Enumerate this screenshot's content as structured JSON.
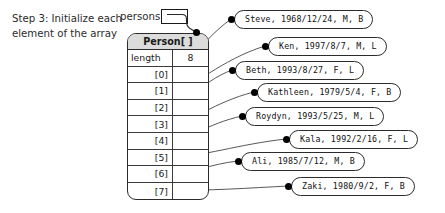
{
  "caption": {
    "text": "Step 3: Initialize each\nelement of the array"
  },
  "pointer_variable": {
    "label": "persons",
    "value": ""
  },
  "array": {
    "type_header": "Person[ ]",
    "length_label": "length",
    "length_value": "8",
    "indices": [
      "[0]",
      "[1]",
      "[2]",
      "[3]",
      "[4]",
      "[5]",
      "[6]",
      "[7]"
    ],
    "cell_values": [
      "",
      "",
      "",
      "",
      "",
      "",
      "",
      ""
    ]
  },
  "records": [
    {
      "index": "[0]",
      "text": "Steve, 1968/12/24, M, B",
      "name": "Steve",
      "birthdate": "1968/12/24",
      "sex": "M",
      "group": "B"
    },
    {
      "index": "[1]",
      "text": "Ken, 1997/8/7, M, L",
      "name": "Ken",
      "birthdate": "1997/8/7",
      "sex": "M",
      "group": "L"
    },
    {
      "index": "[2]",
      "text": "Beth, 1993/8/27, F, L",
      "name": "Beth",
      "birthdate": "1993/8/27",
      "sex": "F",
      "group": "L"
    },
    {
      "index": "[3]",
      "text": "Kathleen, 1979/5/4, F, B",
      "name": "Kathleen",
      "birthdate": "1979/5/4",
      "sex": "F",
      "group": "B"
    },
    {
      "index": "[4]",
      "text": "Roydyn, 1993/5/25, M, L",
      "name": "Roydyn",
      "birthdate": "1993/5/25",
      "sex": "M",
      "group": "L"
    },
    {
      "index": "[5]",
      "text": "Kala, 1992/2/16, F, L",
      "name": "Kala",
      "birthdate": "1992/2/16",
      "sex": "F",
      "group": "L"
    },
    {
      "index": "[6]",
      "text": "Ali, 1985/7/12, M, B",
      "name": "Ali",
      "birthdate": "1985/7/12",
      "sex": "M",
      "group": "B"
    },
    {
      "index": "[7]",
      "text": "Zaki, 1980/9/2, F, B",
      "name": "Zaki",
      "birthdate": "1980/9/2",
      "sex": "F",
      "group": "B"
    }
  ],
  "colors": {
    "stroke": "#2b2b2b",
    "header_fill": "#dcdcdc",
    "text": "#1a1a1a",
    "background": "#ffffff"
  }
}
